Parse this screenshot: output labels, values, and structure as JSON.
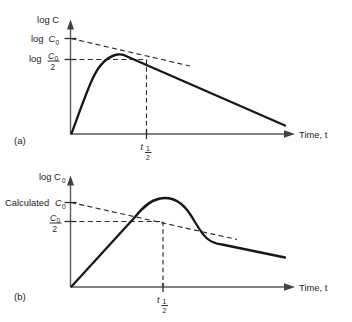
{
  "figure": {
    "background": "#ffffff",
    "ink": "#171717",
    "axis_color": "#555a5c"
  },
  "panels": [
    {
      "tag": "(a)",
      "name": "panel-a",
      "y_axis_label": "log C",
      "x_axis_label": "Time, t",
      "y_ticks": [
        {
          "name": "log-c0",
          "prefix": "log",
          "symbol": "C",
          "subscript": "0",
          "is_fraction": false
        },
        {
          "name": "log-c0-over-2",
          "prefix": "log",
          "symbol": "C",
          "subscript": "0",
          "is_fraction": true,
          "denominator": "2"
        }
      ],
      "x_ticks": [
        {
          "name": "t-half",
          "symbol": "t",
          "numerator": "1",
          "denominator": "2"
        }
      ],
      "curve_description": "flip-flop absorption: steep rise to sharp peak then log-linear terminal decline",
      "dashed_description": "back-extrapolated terminal line to intercept log C0",
      "dashed_horizontal_description": "horizontal line at log C0/2 to the terminal line",
      "dashed_vertical_description": "drop line at t-half"
    },
    {
      "tag": "(b)",
      "name": "panel-b",
      "y_axis_label": "log C₀",
      "y_axis_label_text": "log C",
      "y_axis_label_sub": "0",
      "x_axis_label": "Time, t",
      "y_ticks": [
        {
          "name": "calculated-c0",
          "prefix": "Calculated",
          "symbol": "C",
          "subscript": "0",
          "is_fraction": false
        },
        {
          "name": "c0-over-2",
          "prefix": "",
          "symbol": "C",
          "subscript": "0",
          "is_fraction": true,
          "denominator": "2"
        }
      ],
      "x_ticks": [
        {
          "name": "t-half",
          "symbol": "t",
          "numerator": "1",
          "denominator": "2"
        }
      ],
      "curve_description": "smooth rounded hump rising linearly, peaking, falling and merging into shallow terminal line",
      "dashed_description": "back-extrapolated terminal line to intercept Calculated C0",
      "dashed_horizontal_description": "horizontal line at C0/2 meeting the extrapolated line",
      "dashed_vertical_description": "drop line at t-half"
    }
  ]
}
